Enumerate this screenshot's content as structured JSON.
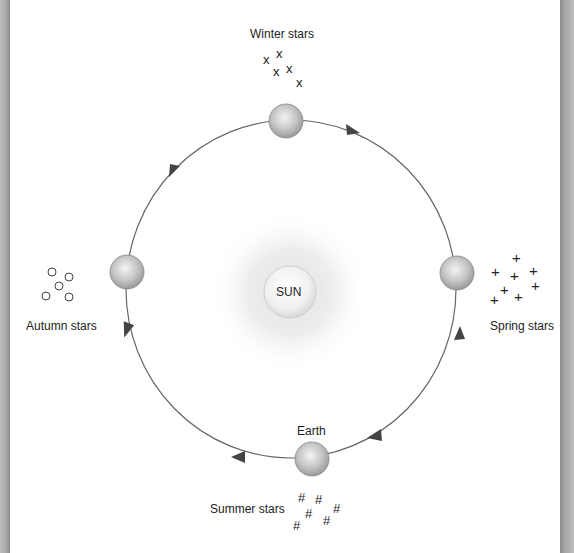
{
  "diagram": {
    "sun_label": "SUN",
    "earth_label": "Earth",
    "constellations": {
      "winter": {
        "label": "Winter stars",
        "glyph": "x"
      },
      "spring": {
        "label": "Spring stars",
        "glyph": "+"
      },
      "summer": {
        "label": "Summer stars",
        "glyph": "#"
      },
      "autumn": {
        "label": "Autumn stars",
        "glyph": "o"
      }
    },
    "orbit_direction": "clockwise",
    "colors": {
      "orbit": "#555555",
      "planet": "#bdbdbd",
      "sun_glow": "#e6e6e6",
      "frame": "#a8a8a8"
    }
  }
}
